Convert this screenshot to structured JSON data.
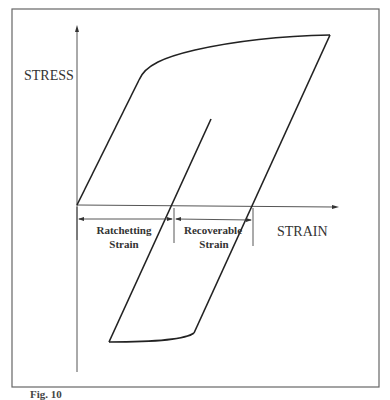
{
  "diagram": {
    "type": "stress-strain hysteresis loop (ratchetting)",
    "y_axis_label": "STRESS",
    "x_axis_label": "STRAIN",
    "annotations": {
      "ratchetting": {
        "line1": "Ratchetting",
        "line2": "Strain"
      },
      "recoverable": {
        "line1": "Recoverable",
        "line2": "Strain"
      }
    },
    "colors": {
      "line": "#222222",
      "frame": "#555555",
      "text": "#333333"
    }
  },
  "caption": "Fig. 10"
}
